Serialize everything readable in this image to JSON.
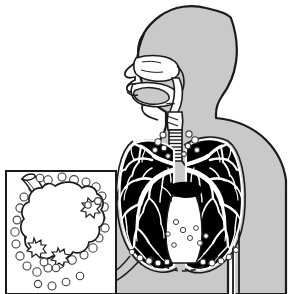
{
  "figure": {
    "title": "Human respiratory system with alveolus detail inset",
    "caption": "Anatomical line illustration of the upper and lower airways, showing inhaled particles travelling through the nasal cavity, mouth, pharynx and trachea into the bronchial trees of both lungs, with a magnified inset of a single alveolus surrounded by particulate matter.",
    "width": 288,
    "height": 294,
    "background_color": "#ffffff"
  },
  "colors": {
    "background": "#ffffff",
    "body_fill": "#c9c9c9",
    "body_fill_shadow": "#bdbdbd",
    "outline": "#1a1a1a",
    "airway_fill": "#ffffff",
    "lung_field": "#000000",
    "bronchial_tree": "#ffffff",
    "particle_fill": "#ffffff",
    "particle_stroke": "#4a4a4a",
    "inset_border": "#1a1a1a",
    "inset_fill": "#ffffff",
    "diaphragm_dashed": "#2b2b2b"
  },
  "parts": {
    "body_silhouette": {
      "name": "body-silhouette",
      "description": "Head, neck, shoulders and torso of a person shown in left-facing three-quarter profile, filled flat gray with a dark contour line."
    },
    "head_profile": {
      "name": "head-profile",
      "description": "Left-facing head with forehead, nose, lips and chin."
    },
    "nasal_cavity": {
      "name": "nasal-cavity",
      "description": "White airway channel behind the nose leading back to the pharynx."
    },
    "oral_cavity": {
      "name": "oral-cavity",
      "description": "Mouth opening with tongue and lips drawn in outline."
    },
    "tongue": {
      "name": "tongue",
      "description": "Gray tongue body inside the oral cavity."
    },
    "pharynx": {
      "name": "pharynx",
      "description": "Throat passage joining the nasal and oral cavities to the larynx."
    },
    "larynx": {
      "name": "larynx",
      "description": "Voice box segment at the top of the trachea with two short oblique marks."
    },
    "trachea": {
      "name": "trachea",
      "description": "Vertical windpipe drawn as a ladder of horizontal cartilage rings descending into the chest."
    },
    "carina": {
      "name": "carina",
      "description": "Point where the trachea divides into the left and right main bronchi."
    },
    "left_lung": {
      "name": "left-lung",
      "description": "Lung field on the viewer's right rendered as a solid black silhouette."
    },
    "right_lung": {
      "name": "right-lung",
      "description": "Lung field on the viewer's left rendered as a solid black silhouette."
    },
    "bronchial_tree": {
      "name": "bronchial-tree",
      "description": "White branching airway tree radiating through both black lung fields from the main bronchi to the periphery."
    },
    "heart_notch": {
      "name": "heart-notch",
      "description": "White unshaded wedge between the lower lungs marking the cardiac space."
    },
    "diaphragm": {
      "name": "diaphragm",
      "description": "Dashed arc beneath the lungs indicating the diaphragm."
    },
    "arm": {
      "name": "arm",
      "description": "Upper arm separated from the torso by a narrow white gap at the lower right."
    },
    "particles": {
      "name": "inhaled-particles",
      "description": "Small white circles with dark outlines representing airborne dust or pollutant particles, clustered around the trachea, the lung bases and throughout the inset."
    },
    "leader_line": {
      "name": "inset-leader-line",
      "description": "Long curved line sweeping from the lower edge of the left lung down to the magnified inset box."
    },
    "inset_box": {
      "name": "alveolus-inset-box",
      "description": "Square framed panel at the lower left holding the magnified alveolus view."
    },
    "alveolus": {
      "name": "alveolus",
      "description": "Large scalloped white air sac that fills the inset panel."
    },
    "bronchiole": {
      "name": "terminal-bronchiole",
      "description": "Short cut-open tube entering the alveolus from the upper left of the inset."
    },
    "deposits": {
      "name": "particle-deposits",
      "description": "Jagged starburst clusters on the alveolar wall where particles have settled."
    }
  },
  "annotations": {
    "particle_count_inset": 38,
    "particle_count_airway": 22,
    "labels": []
  }
}
